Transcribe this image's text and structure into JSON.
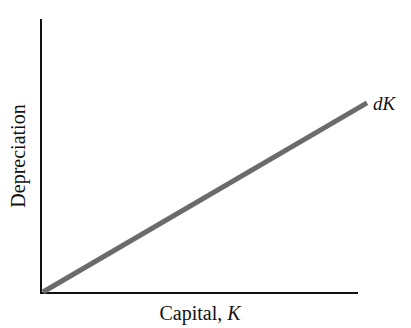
{
  "chart_data": {
    "type": "line",
    "title": "",
    "xlabel": "Capital, K",
    "xlabel_parts": {
      "text": "Capital, ",
      "italic": "K"
    },
    "ylabel": "Depreciation",
    "x_ticks": [],
    "y_ticks": [],
    "grid": false,
    "legend": "none",
    "series": [
      {
        "name": "dK",
        "label_parts": {
          "normal": "d",
          "italic": "K"
        },
        "description": "Depreciation line proportional to capital, starting at origin",
        "x": [
          0,
          1
        ],
        "y": [
          0,
          0.69
        ],
        "color": "#6b6b6b"
      }
    ],
    "annotations": [
      {
        "text": "dK",
        "position": "end of line, upper right"
      }
    ]
  },
  "colors": {
    "axis": "#111111",
    "line": "#6b6b6b",
    "text": "#111111",
    "background": "#ffffff"
  }
}
